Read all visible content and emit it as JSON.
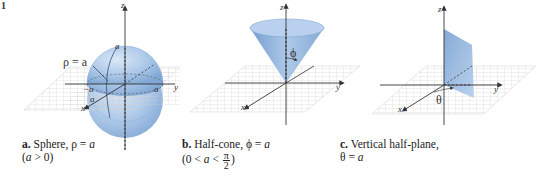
{
  "figure": {
    "number_fragment": "1",
    "panels": [
      {
        "id": "a",
        "shape": "sphere",
        "caption_letter": "a.",
        "caption_title": "Sphere, ",
        "caption_eq_symbol": "ρ",
        "caption_eq_rest": " = ",
        "caption_eq_value": "a",
        "condition_open": "(",
        "condition_var": "a",
        "condition_rest": " > 0)",
        "annotation": "ρ = a",
        "axis_labels": {
          "z": "z",
          "y": "y",
          "x": "x"
        },
        "tick_labels": {
          "top": "a",
          "left": "−a",
          "right": "a",
          "front": "a"
        }
      },
      {
        "id": "b",
        "shape": "half-cone",
        "caption_letter": "b.",
        "caption_title": "Half-cone, ",
        "caption_eq_symbol": "ϕ",
        "caption_eq_rest": " = ",
        "caption_eq_value": "a",
        "condition_prefix": "(0 < ",
        "condition_var": "a",
        "condition_lt": " < ",
        "condition_frac_num": "π",
        "condition_frac_den": "2",
        "condition_suffix": ")",
        "annotation": "ϕ",
        "axis_labels": {
          "z": "z",
          "y": "y",
          "x": "x"
        }
      },
      {
        "id": "c",
        "shape": "vertical-half-plane",
        "caption_letter": "c.",
        "caption_title": "Vertical half-plane,",
        "caption_eq_symbol": "θ",
        "caption_eq_rest": " = ",
        "caption_eq_value": "a",
        "annotation": "θ",
        "axis_labels": {
          "z": "z",
          "y": "y",
          "x": "x"
        }
      }
    ],
    "colors": {
      "surface_fill": "#a9c6e8",
      "surface_dark": "#6f98cc",
      "grid": "#c8c8c8",
      "axis": "#333333"
    }
  }
}
